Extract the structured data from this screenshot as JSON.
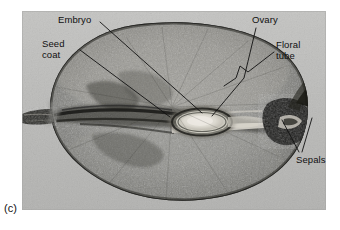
{
  "figure": {
    "letter": "(c)",
    "caption_visible": false,
    "plate_type": "grayscale-photomicrograph",
    "background_color": "#ffffff",
    "plate_background_color": "#b9b9b7",
    "label_text_color": "#101010",
    "leader_line_color": "#111111"
  },
  "labels": {
    "embryo": {
      "text": "Embryo",
      "lines": [
        "Embryo"
      ],
      "position": "top-left"
    },
    "seed_coat": {
      "text": "Seed coat",
      "lines": [
        "Seed",
        "coat"
      ],
      "position": "upper-left"
    },
    "ovary": {
      "text": "Ovary",
      "lines": [
        "Ovary"
      ],
      "position": "top-right"
    },
    "floral_tube": {
      "text": "Floral tube",
      "lines": [
        "Floral",
        "tube"
      ],
      "position": "upper-right"
    },
    "sepals": {
      "text": "Sepals",
      "lines": [
        "Sepals"
      ],
      "position": "lower-right"
    }
  },
  "specimen": {
    "outline": "broad ovate seed body occupying most of the plate",
    "features": [
      "dark stalk / funiculus projecting from the left edge",
      "pale oval embryo near the centre surrounded by concentric rings",
      "dark horizontal vascular strand running left of centre",
      "dark spurred sepal structure at the right margin"
    ]
  }
}
